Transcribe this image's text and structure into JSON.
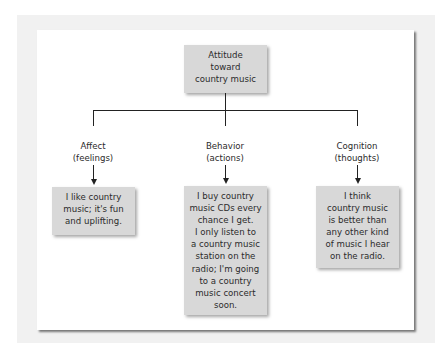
{
  "diagram": {
    "type": "hierarchy",
    "root": {
      "label": "Attitude\ntoward\ncountry music"
    },
    "components": [
      {
        "label": "Affect\n(feelings)",
        "example": "I like country\nmusic; it's fun\nand uplifting."
      },
      {
        "label": "Behavior\n(actions)",
        "example": "I buy country\nmusic CDs every\nchance I get.\nI only listen to\na country music\nstation on the\nradio; I'm going\nto a country\nmusic concert\nsoon."
      },
      {
        "label": "Cognition\n(thoughts)",
        "example": "I think\ncountry music\nis better than\nany other kind\nof music I hear\non the radio."
      }
    ],
    "colors": {
      "box_fill": "#d8d8d8",
      "line": "#222222",
      "frame": "#f1f1f1",
      "panel": "#ffffff"
    }
  }
}
